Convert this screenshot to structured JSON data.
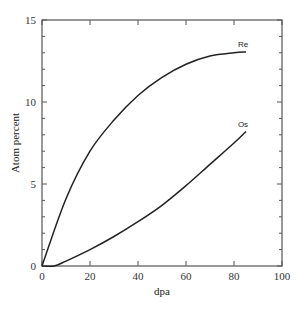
{
  "chart_data": {
    "type": "line",
    "title": "",
    "xlabel": "dpa",
    "ylabel": "Atom percent",
    "xlim": [
      0,
      100
    ],
    "ylim": [
      0,
      15
    ],
    "xticks": [
      0,
      20,
      40,
      60,
      80,
      100
    ],
    "yticks": [
      0,
      5,
      10,
      15
    ],
    "grid": false,
    "legend": "inline labels at line ends",
    "series": [
      {
        "name": "Re",
        "x": [
          0,
          10,
          20,
          30,
          40,
          50,
          60,
          70,
          80,
          85
        ],
        "y": [
          0,
          4.1,
          7.0,
          8.9,
          10.4,
          11.5,
          12.3,
          12.8,
          13.0,
          13.05
        ]
      },
      {
        "name": "Os",
        "x": [
          0,
          5,
          10,
          20,
          30,
          40,
          50,
          60,
          70,
          80,
          85
        ],
        "y": [
          0,
          0,
          0.3,
          1.0,
          1.8,
          2.7,
          3.7,
          4.9,
          6.2,
          7.5,
          8.2
        ]
      }
    ]
  },
  "labels": {
    "xlabel": "dpa",
    "ylabel": "Atom percent",
    "series_re": "Re",
    "series_os": "Os"
  },
  "style": {
    "line_color": "#222222",
    "axis_color": "#555555"
  }
}
